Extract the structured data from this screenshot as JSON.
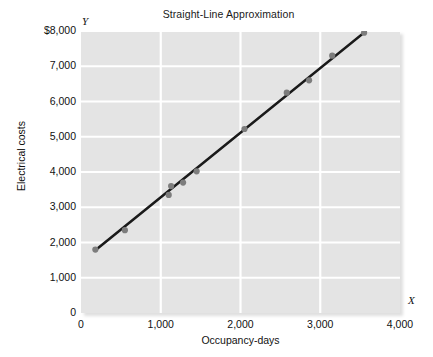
{
  "chart_data": {
    "type": "scatter",
    "title": "Straight-Line Approximation",
    "xlabel": "Occupancy-days",
    "ylabel": "Electrical costs",
    "x_axis_symbol": "X",
    "y_axis_symbol": "Y",
    "xlim": [
      0,
      4000
    ],
    "ylim": [
      0,
      8000
    ],
    "grid": true,
    "legend": null,
    "xticks": [
      0,
      1000,
      2000,
      3000,
      4000
    ],
    "xtick_labels": [
      "0",
      "1,000",
      "2,000",
      "3,000",
      "4,000"
    ],
    "yticks": [
      0,
      1000,
      2000,
      3000,
      4000,
      5000,
      6000,
      7000,
      8000
    ],
    "ytick_labels": [
      "0",
      "1,000",
      "2,000",
      "3,000",
      "4,000",
      "5,000",
      "6,000",
      "7,000",
      "$8,000"
    ],
    "series": [
      {
        "name": "Observations",
        "type": "scatter",
        "marker_color": "#7d7d7d",
        "points": [
          {
            "x": 180,
            "y": 1800
          },
          {
            "x": 550,
            "y": 2350
          },
          {
            "x": 1100,
            "y": 3350
          },
          {
            "x": 1130,
            "y": 3600
          },
          {
            "x": 1280,
            "y": 3700
          },
          {
            "x": 1450,
            "y": 4020
          },
          {
            "x": 2050,
            "y": 5220
          },
          {
            "x": 2580,
            "y": 6250
          },
          {
            "x": 2860,
            "y": 6600
          },
          {
            "x": 3150,
            "y": 7300
          },
          {
            "x": 3550,
            "y": 7950
          }
        ]
      },
      {
        "name": "Straight-line approximation",
        "type": "line",
        "line_color": "#1a1a1a",
        "points": [
          {
            "x": 180,
            "y": 1780
          },
          {
            "x": 3570,
            "y": 7990
          }
        ]
      }
    ],
    "plot_background": "#e4e4e4",
    "gridline_color": "#ffffff"
  }
}
